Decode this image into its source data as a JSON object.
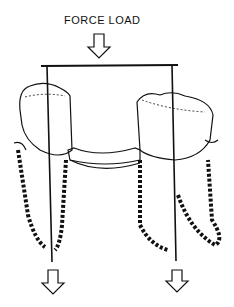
{
  "diagram": {
    "title_label": "FORCE LOAD",
    "stroke_color": "#111111",
    "background": "#ffffff",
    "elements": [
      "force-arrow-down",
      "load-bar",
      "left-tooth",
      "right-tooth",
      "bridge-pontic",
      "left-reaction-arrow",
      "right-reaction-arrow"
    ]
  }
}
